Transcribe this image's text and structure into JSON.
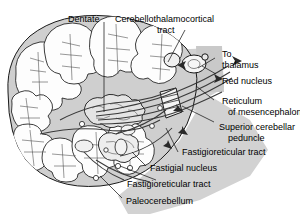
{
  "figure": {
    "colors": {
      "background": "#ffffff",
      "ink": "#1a1a1a",
      "brainstem_gray": "#d2d2d2",
      "cerebellum_gray": "#cfcfcf",
      "folia_fill": "#fdfdfd",
      "tract_line": "#3a3a3a"
    }
  },
  "labels": {
    "dentate": "Dentate",
    "cerebellothalamocortical_1": "Cerebellothalamocortical",
    "cerebellothalamocortical_2": "tract",
    "to_thalamus_1": "To",
    "to_thalamus_2": "thalamus",
    "red_nucleus": "Red nucleus",
    "reticulum_1": "Reticulum",
    "reticulum_2": "of mesencephalon",
    "superior_peduncle_1": "Superior cerebellar",
    "superior_peduncle_2": "peduncle",
    "fastigioreticular_upper": "Fastigioreticular tract",
    "fastigial_nucleus": "Fastigial nucleus",
    "fastigioreticular_lower": "Fastigioreticular tract",
    "paleocerebellum": "Paleocerebellum"
  }
}
